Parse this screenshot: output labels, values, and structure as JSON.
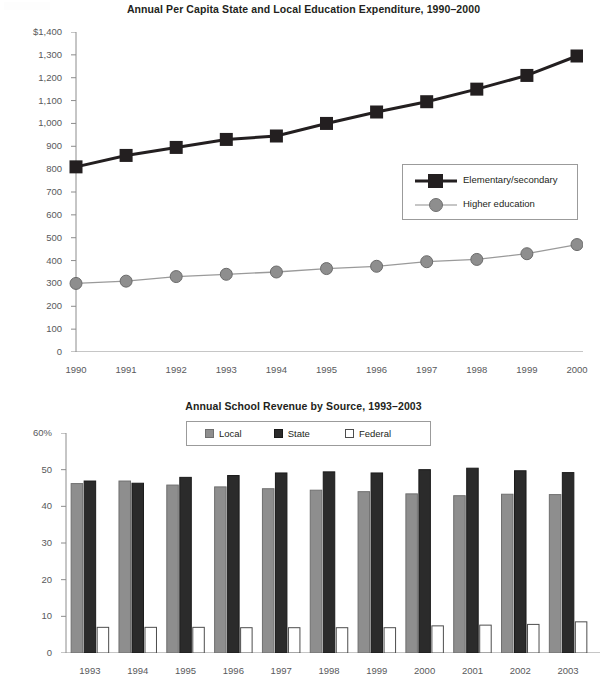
{
  "chart_data": [
    {
      "type": "line",
      "title": "Annual Per Capita State and Local Education Expenditure, 1990–2000",
      "xlabel": "",
      "ylabel": "",
      "x": [
        1990,
        1991,
        1992,
        1993,
        1994,
        1995,
        1996,
        1997,
        1998,
        1999,
        2000
      ],
      "categories": [
        "1990",
        "1991",
        "1992",
        "1993",
        "1994",
        "1995",
        "1996",
        "1997",
        "1998",
        "1999",
        "2000"
      ],
      "ylim": [
        0,
        1400
      ],
      "ytick_labels": [
        "$1,400",
        "1,300",
        "1,200",
        "1,100",
        "1,000",
        "900",
        "800",
        "700",
        "600",
        "500",
        "400",
        "300",
        "200",
        "100",
        "0"
      ],
      "ytick_values": [
        1400,
        1300,
        1200,
        1100,
        1000,
        900,
        800,
        700,
        600,
        500,
        400,
        300,
        200,
        100,
        0
      ],
      "grid": false,
      "legend_position": "inside-right",
      "series": [
        {
          "name": "Elementary/secondary",
          "color": "#231f20",
          "marker": "square",
          "values": [
            810,
            860,
            895,
            930,
            945,
            1000,
            1050,
            1095,
            1150,
            1210,
            1295
          ]
        },
        {
          "name": "Higher education",
          "color": "#8e8e8e",
          "marker": "circle",
          "values": [
            300,
            310,
            330,
            340,
            350,
            365,
            375,
            395,
            405,
            430,
            470
          ]
        }
      ]
    },
    {
      "type": "bar",
      "title": "Annual School Revenue by Source, 1993–2003",
      "xlabel": "",
      "ylabel": "",
      "categories": [
        "1993",
        "1994",
        "1995",
        "1996",
        "1997",
        "1998",
        "1999",
        "2000",
        "2001",
        "2002",
        "2003"
      ],
      "ylim": [
        0,
        60
      ],
      "ytick_labels": [
        "60%",
        "50",
        "40",
        "30",
        "20",
        "10",
        "0"
      ],
      "ytick_values": [
        60,
        50,
        40,
        30,
        20,
        10,
        0
      ],
      "grid": false,
      "legend_position": "top-center",
      "series": [
        {
          "name": "Local",
          "color": "#8e8e8e",
          "values": [
            46.2,
            46.9,
            45.8,
            45.3,
            44.8,
            44.4,
            44.0,
            43.4,
            42.9,
            43.3,
            43.2
          ]
        },
        {
          "name": "State",
          "color": "#2b2b2b",
          "values": [
            46.9,
            46.3,
            47.9,
            48.4,
            49.1,
            49.4,
            49.1,
            50.0,
            50.4,
            49.7,
            49.2
          ]
        },
        {
          "name": "Federal",
          "color": "#ffffff",
          "values": [
            7.0,
            7.0,
            7.0,
            6.9,
            6.9,
            6.9,
            6.9,
            7.4,
            7.6,
            7.8,
            8.5
          ]
        }
      ]
    }
  ]
}
